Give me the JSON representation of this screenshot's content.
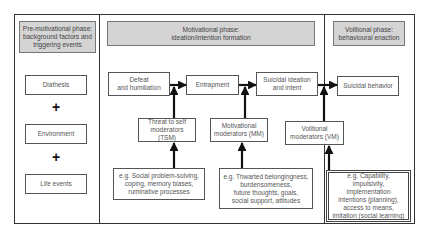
{
  "phases": {
    "pre_motivational": {
      "header": "Pre-motivational phase:\nbackground factors and\ntriggering events",
      "items": [
        "Diathesis",
        "Environment",
        "Life events"
      ],
      "connector": "+"
    },
    "motivational": {
      "header": "Motivational phase:\nideation/intention formation",
      "flow": [
        "Defeat\nand humiliation",
        "Entrapment",
        "Suicidal ideation\nand intent"
      ],
      "moderators": [
        {
          "label": "Threat to self\nmoderators (TSM)",
          "examples": "e.g. Social problem-solving,\ncoping, memory biases,\nruminative processes"
        },
        {
          "label": "Motivational\nmoderators (MM)",
          "examples": "e.g. Thwarted belongingness,\nburdensomeness,\nfuture thoughts, goals,\nsocial support, attitudes"
        },
        {
          "label": "Volitional\nmoderators (VM)",
          "examples": "e.g. Capability,\nimpulsivity,\nimplementation\nintentions (planning),\naccess to means,\nimitation (social learning)"
        }
      ]
    },
    "volitional": {
      "header": "Volitional phase:\nbehavioural enaction",
      "outcome": "Suicidal behavior"
    }
  },
  "colors": {
    "header_fill": "#d4d4d4",
    "border": "#333333",
    "arrow": "#111111"
  }
}
